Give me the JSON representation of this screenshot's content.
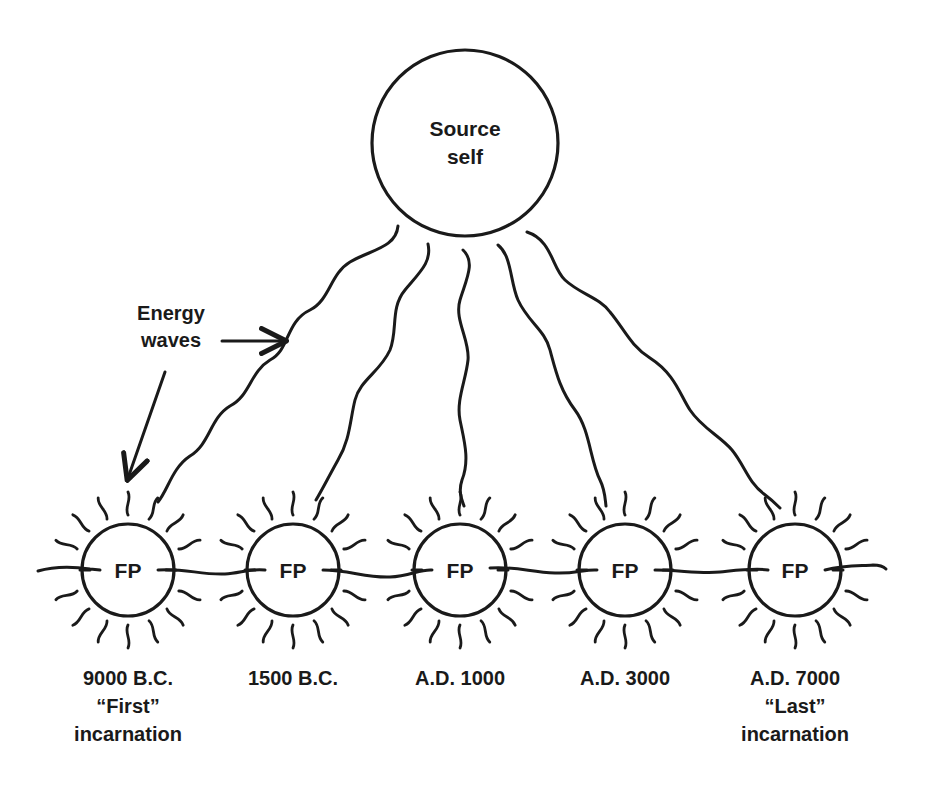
{
  "source": {
    "label_line1": "Source",
    "label_line2": "self",
    "cx": 465,
    "cy": 143,
    "r": 93
  },
  "annotation": {
    "line1": "Energy",
    "line2": "waves"
  },
  "focus_personalities": [
    {
      "label": "FP",
      "cx": 128,
      "cy": 570,
      "caption": [
        "9000 B.C.",
        "“First”",
        "incarnation"
      ]
    },
    {
      "label": "FP",
      "cx": 293,
      "cy": 570,
      "caption": [
        "1500 B.C."
      ]
    },
    {
      "label": "FP",
      "cx": 460,
      "cy": 570,
      "caption": [
        "A.D. 1000"
      ]
    },
    {
      "label": "FP",
      "cx": 625,
      "cy": 570,
      "caption": [
        "A.D. 3000"
      ]
    },
    {
      "label": "FP",
      "cx": 795,
      "cy": 570,
      "caption": [
        "A.D. 7000",
        "“Last”",
        "incarnation"
      ]
    }
  ],
  "colors": {
    "ink": "#1a1a1a",
    "background": "#ffffff"
  }
}
